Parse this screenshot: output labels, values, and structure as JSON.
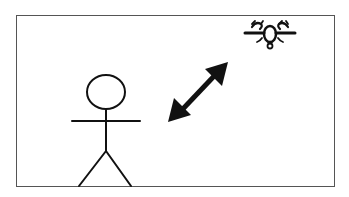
{
  "diagram": {
    "elements": [
      {
        "id": "person",
        "type": "stick-figure",
        "icon": "person-icon"
      },
      {
        "id": "arrow",
        "type": "double-headed-arrow",
        "icon": "bidirectional-arrow-icon"
      },
      {
        "id": "drone",
        "type": "drone",
        "icon": "drone-icon"
      }
    ],
    "colors": {
      "stroke": "#111111",
      "frame": "#555555",
      "background": "#ffffff"
    }
  }
}
